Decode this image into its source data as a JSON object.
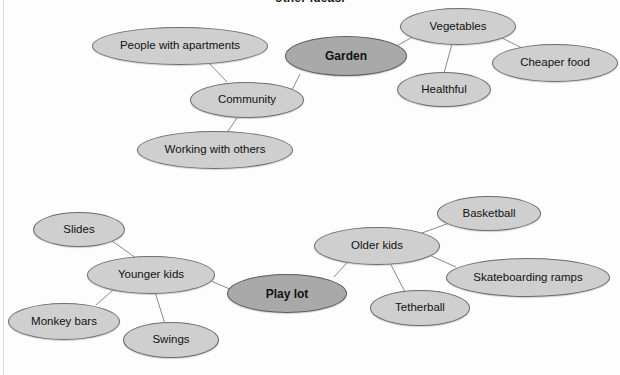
{
  "page": {
    "clipped_heading": "other ideas.",
    "background_color": "#fdfdfd",
    "node_fill": "#cfcfcf",
    "central_node_fill": "#a9a9a9",
    "node_stroke": "#6e6e6e",
    "edge_color": "#8a8a8a",
    "text_color": "#111111"
  },
  "chart_data": {
    "type": "diagram",
    "subtype": "concept-map",
    "title": "other ideas.",
    "maps": [
      {
        "name": "garden-map",
        "center": "Garden",
        "nodes": [
          "Garden",
          "People with apartments",
          "Community",
          "Working with others",
          "Vegetables",
          "Healthful",
          "Cheaper food"
        ],
        "edges": [
          [
            "Garden",
            "Community"
          ],
          [
            "Community",
            "People with apartments"
          ],
          [
            "Community",
            "Working with others"
          ],
          [
            "Garden",
            "Vegetables"
          ],
          [
            "Vegetables",
            "Healthful"
          ],
          [
            "Vegetables",
            "Cheaper food"
          ]
        ]
      },
      {
        "name": "play-lot-map",
        "center": "Play lot",
        "nodes": [
          "Play lot",
          "Younger kids",
          "Slides",
          "Monkey bars",
          "Swings",
          "Older kids",
          "Basketball",
          "Skateboarding ramps",
          "Tetherball"
        ],
        "edges": [
          [
            "Play lot",
            "Younger kids"
          ],
          [
            "Younger kids",
            "Slides"
          ],
          [
            "Younger kids",
            "Monkey bars"
          ],
          [
            "Younger kids",
            "Swings"
          ],
          [
            "Play lot",
            "Older kids"
          ],
          [
            "Older kids",
            "Basketball"
          ],
          [
            "Older kids",
            "Skateboarding ramps"
          ],
          [
            "Older kids",
            "Tetherball"
          ]
        ]
      }
    ]
  },
  "nodes": [
    {
      "id": "people-with-apartments",
      "label": "People with apartments",
      "central": false,
      "x": 92,
      "y": 27,
      "w": 176,
      "h": 38
    },
    {
      "id": "garden",
      "label": "Garden",
      "central": true,
      "x": 285,
      "y": 36,
      "w": 122,
      "h": 40
    },
    {
      "id": "vegetables",
      "label": "Vegetables",
      "central": false,
      "x": 400,
      "y": 8,
      "w": 116,
      "h": 37
    },
    {
      "id": "cheaper-food",
      "label": "Cheaper food",
      "central": false,
      "x": 492,
      "y": 44,
      "w": 126,
      "h": 38
    },
    {
      "id": "healthful",
      "label": "Healthful",
      "central": false,
      "x": 397,
      "y": 72,
      "w": 94,
      "h": 35
    },
    {
      "id": "community",
      "label": "Community",
      "central": false,
      "x": 190,
      "y": 82,
      "w": 114,
      "h": 36
    },
    {
      "id": "working-with-others",
      "label": "Working with others",
      "central": false,
      "x": 137,
      "y": 131,
      "w": 156,
      "h": 38
    },
    {
      "id": "slides",
      "label": "Slides",
      "central": false,
      "x": 33,
      "y": 212,
      "w": 92,
      "h": 35
    },
    {
      "id": "basketball",
      "label": "Basketball",
      "central": false,
      "x": 437,
      "y": 196,
      "w": 104,
      "h": 35
    },
    {
      "id": "older-kids",
      "label": "Older kids",
      "central": false,
      "x": 314,
      "y": 227,
      "w": 126,
      "h": 38
    },
    {
      "id": "younger-kids",
      "label": "Younger kids",
      "central": false,
      "x": 87,
      "y": 256,
      "w": 128,
      "h": 38
    },
    {
      "id": "skateboarding-ramps",
      "label": "Skateboarding ramps",
      "central": false,
      "x": 446,
      "y": 258,
      "w": 164,
      "h": 39
    },
    {
      "id": "play-lot",
      "label": "Play lot",
      "central": true,
      "x": 227,
      "y": 274,
      "w": 120,
      "h": 39
    },
    {
      "id": "monkey-bars",
      "label": "Monkey bars",
      "central": false,
      "x": 8,
      "y": 303,
      "w": 112,
      "h": 37
    },
    {
      "id": "tetherball",
      "label": "Tetherball",
      "central": false,
      "x": 370,
      "y": 290,
      "w": 100,
      "h": 36
    },
    {
      "id": "swings",
      "label": "Swings",
      "central": false,
      "x": 123,
      "y": 322,
      "w": 96,
      "h": 36
    }
  ],
  "edges": [
    {
      "id": "edge-community-people",
      "x1": 227,
      "y1": 82,
      "x2": 208,
      "y2": 62
    },
    {
      "id": "edge-community-working",
      "x1": 237,
      "y1": 118,
      "x2": 226,
      "y2": 134
    },
    {
      "id": "edge-community-garden",
      "x1": 292,
      "y1": 90,
      "x2": 300,
      "y2": 74
    },
    {
      "id": "edge-garden-vegetables",
      "x1": 393,
      "y1": 48,
      "x2": 416,
      "y2": 35
    },
    {
      "id": "edge-vegetables-healthful",
      "x1": 452,
      "y1": 44,
      "x2": 444,
      "y2": 73
    },
    {
      "id": "edge-vegetables-cheaper",
      "x1": 500,
      "y1": 37,
      "x2": 522,
      "y2": 48
    },
    {
      "id": "edge-younger-slides",
      "x1": 136,
      "y1": 258,
      "x2": 108,
      "y2": 238
    },
    {
      "id": "edge-younger-monkey",
      "x1": 113,
      "y1": 290,
      "x2": 96,
      "y2": 305
    },
    {
      "id": "edge-younger-swings",
      "x1": 155,
      "y1": 292,
      "x2": 165,
      "y2": 324
    },
    {
      "id": "edge-younger-playlot",
      "x1": 211,
      "y1": 281,
      "x2": 232,
      "y2": 290
    },
    {
      "id": "edge-playlot-older",
      "x1": 334,
      "y1": 277,
      "x2": 352,
      "y2": 257
    },
    {
      "id": "edge-older-basketball",
      "x1": 422,
      "y1": 233,
      "x2": 452,
      "y2": 222
    },
    {
      "id": "edge-older-skateboarding",
      "x1": 429,
      "y1": 255,
      "x2": 456,
      "y2": 267
    },
    {
      "id": "edge-older-tetherball",
      "x1": 389,
      "y1": 261,
      "x2": 405,
      "y2": 292
    }
  ]
}
